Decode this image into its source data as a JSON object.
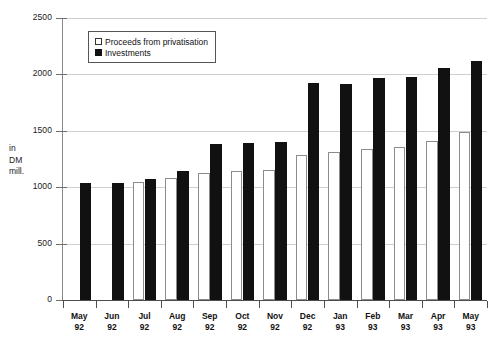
{
  "chart_data": {
    "type": "bar",
    "title": "",
    "subtitle": "",
    "xlabel": "",
    "ylabel": "in DM mill.",
    "ylim": [
      0,
      2500
    ],
    "ytick_step": 500,
    "yticks": [
      2500,
      2000,
      1500,
      1000,
      500,
      0
    ],
    "ytick_labels": [
      "2500",
      "2000",
      "1500",
      "1000",
      "500",
      "0"
    ],
    "grid": true,
    "grid_axis": "y",
    "legend_position": "top-left-inside",
    "categories": [
      "May 92",
      "Jun 92",
      "Jul 92",
      "Aug 92",
      "Sep 92",
      "Oct 92",
      "Nov 92",
      "Dec 92",
      "Jan 93",
      "Feb 93",
      "Mar 93",
      "Apr 93",
      "May 93"
    ],
    "category_lines": [
      [
        "May",
        "92"
      ],
      [
        "Jun",
        "92"
      ],
      [
        "Jul",
        "92"
      ],
      [
        "Aug",
        "92"
      ],
      [
        "Sep",
        "92"
      ],
      [
        "Oct",
        "92"
      ],
      [
        "Nov",
        "92"
      ],
      [
        "Dec",
        "92"
      ],
      [
        "Jan",
        "93"
      ],
      [
        "Feb",
        "93"
      ],
      [
        "Mar",
        "93"
      ],
      [
        "Apr",
        "93"
      ],
      [
        "May",
        "93"
      ]
    ],
    "series": [
      {
        "name": "Proceeds from privatisation",
        "color": "#ffffff",
        "edge_color": "#8c8c8c",
        "values": [
          0,
          0,
          1050,
          1080,
          1125,
          1140,
          1155,
          1290,
          1310,
          1335,
          1360,
          1410,
          1490
        ]
      },
      {
        "name": "Investments",
        "color": "#111111",
        "edge_color": "#111111",
        "values": [
          1035,
          1040,
          1075,
          1140,
          1385,
          1390,
          1400,
          1920,
          1915,
          1965,
          1980,
          2060,
          2120
        ]
      }
    ]
  },
  "legend": {
    "items": [
      {
        "label": "Proceeds from privatisation",
        "swatch": "open"
      },
      {
        "label": "Investments",
        "swatch": "filled"
      }
    ]
  },
  "axis_unit": {
    "line1": "in",
    "line2": "DM",
    "line3": "mill."
  }
}
